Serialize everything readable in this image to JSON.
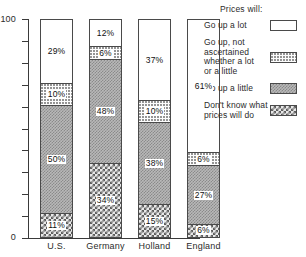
{
  "chart_data": {
    "type": "bar",
    "subtype": "stacked-percentage-column",
    "title": "",
    "xlabel": "",
    "ylabel": "",
    "ylim": [
      0,
      100
    ],
    "ytick_values": [
      0,
      10,
      20,
      30,
      40,
      50,
      60,
      70,
      80,
      90,
      100
    ],
    "ytick_labels_shown": [
      "0",
      "100"
    ],
    "grid": false,
    "categories": [
      "U.S.",
      "Germany",
      "Holland",
      "England"
    ],
    "series": [
      {
        "name": "Go up a lot",
        "pattern": "white",
        "values": [
          29,
          12,
          37,
          61
        ],
        "labels": [
          "29%",
          "12%",
          "37%",
          "61%"
        ]
      },
      {
        "name": "Go up, not ascertained whether a lot or a little",
        "pattern": "dots",
        "values": [
          10,
          6,
          10,
          6
        ],
        "labels": [
          "10%",
          "6%",
          "10%",
          "6%"
        ]
      },
      {
        "name": "Go up a little",
        "pattern": "gray",
        "values": [
          50,
          48,
          38,
          27
        ],
        "labels": [
          "50%",
          "48%",
          "38%",
          "27%"
        ]
      },
      {
        "name": "Don't know what prices will do",
        "pattern": "check",
        "values": [
          11,
          34,
          15,
          6
        ],
        "labels": [
          "11%",
          "34%",
          "15%",
          "6%"
        ]
      }
    ],
    "legend_position": "right",
    "legend_title": "Prices will:"
  },
  "axes": {
    "y_top_label": "100",
    "y_bottom_label": "0"
  },
  "legend": {
    "title": "Prices will:",
    "entries": [
      {
        "lines": [
          "Go up a lot"
        ],
        "pattern": "white"
      },
      {
        "lines": [
          "Go up, not",
          "ascertained",
          "whether a lot",
          "or a little"
        ],
        "pattern": "dots"
      },
      {
        "lines": [
          "Go up a little"
        ],
        "pattern": "gray"
      },
      {
        "lines": [
          "Don't know what",
          "prices will do"
        ],
        "pattern": "check"
      }
    ]
  }
}
